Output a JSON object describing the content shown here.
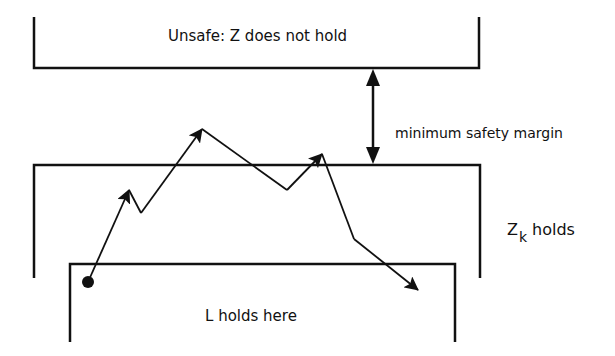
{
  "diagram": {
    "regions": {
      "unsafe": {
        "label": "Unsafe: Z does not hold"
      },
      "zk": {
        "label_main": "Z",
        "label_sub": "k",
        "label_rest": "holds"
      },
      "l": {
        "label": "L holds here"
      }
    },
    "margin": {
      "label": "minimum safety margin"
    },
    "trajectory": {
      "start": [
        88,
        282
      ],
      "points": [
        [
          88,
          282
        ],
        [
          129,
          190
        ],
        [
          141,
          213
        ],
        [
          202,
          129
        ],
        [
          287,
          190
        ],
        [
          322,
          154
        ],
        [
          354,
          239
        ],
        [
          418,
          290
        ]
      ]
    },
    "colors": {
      "stroke": "#111111",
      "background": "#ffffff"
    }
  }
}
